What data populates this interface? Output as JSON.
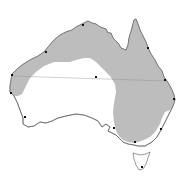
{
  "map": {
    "subject": "Australia",
    "colors": {
      "background": "#ffffff",
      "land": "#ffffff",
      "shaded_region": "#bdbdbd",
      "coastline": "#555555",
      "tropic_line": "#8a8a8a",
      "city_dot": "#111111"
    },
    "features": {
      "tropic_line": "Tropic of Capricorn",
      "shaded_region": "shaded region"
    },
    "cities": [
      {
        "id": "darwin",
        "x": 83,
        "y": 25
      },
      {
        "id": "broome",
        "x": 46,
        "y": 52
      },
      {
        "id": "carnarvon",
        "x": 12,
        "y": 75
      },
      {
        "id": "geraldton",
        "x": 11,
        "y": 93
      },
      {
        "id": "perth",
        "x": 25,
        "y": 117
      },
      {
        "id": "alice-springs",
        "x": 96,
        "y": 77
      },
      {
        "id": "cairns",
        "x": 148,
        "y": 48
      },
      {
        "id": "rockhampton",
        "x": 165,
        "y": 80
      },
      {
        "id": "brisbane",
        "x": 174,
        "y": 99
      },
      {
        "id": "sydney",
        "x": 161,
        "y": 129
      },
      {
        "id": "melbourne",
        "x": 135,
        "y": 142
      },
      {
        "id": "adelaide",
        "x": 114,
        "y": 128
      },
      {
        "id": "hobart",
        "x": 142,
        "y": 167
      }
    ]
  }
}
